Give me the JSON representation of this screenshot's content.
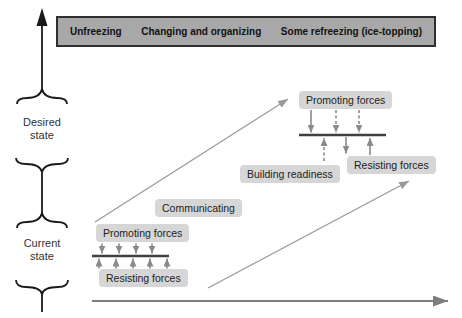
{
  "banner": {
    "phases": [
      "Unfreezing",
      "Changing and organizing",
      "Some refreezing (ice-topping)"
    ]
  },
  "vertical_axis": {
    "desired_state_label": "Desired state",
    "current_state_label": "Current state"
  },
  "lower_cluster": {
    "promoting_label": "Promoting forces",
    "resisting_label": "Resisting forces",
    "communicating_label": "Communicating"
  },
  "upper_cluster": {
    "promoting_label": "Promoting forces",
    "resisting_label": "Resisting forces",
    "building_readiness_label": "Building readiness"
  },
  "colors": {
    "banner_fill": "#a8a8a8",
    "banner_border": "#2f2f2f",
    "label_box_bg": "#d6d6d6",
    "label_text": "#222222",
    "vertical_axis_black": "#1a1a1a",
    "force_line": "#3f3f3f",
    "force_arrow_gray": "#8a8a8a",
    "diagonal_arrow_gray": "#999999",
    "time_axis_gray": "#7d7d7d"
  }
}
